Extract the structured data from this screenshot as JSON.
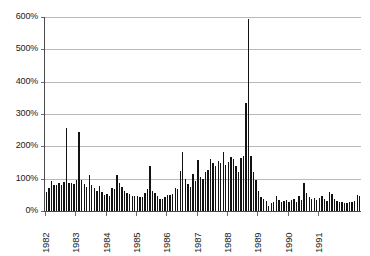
{
  "chart_data": {
    "type": "bar",
    "title": "",
    "subtitle": "",
    "xlabel": "",
    "ylabel": "",
    "ylim": [
      0,
      600
    ],
    "ytick_values": [
      0,
      100,
      200,
      300,
      400,
      500,
      600
    ],
    "ytick_labels": [
      "0%",
      "100%",
      "200%",
      "300%",
      "400%",
      "500%",
      "600%"
    ],
    "xtick_labels": [
      "1982",
      "1983",
      "1984",
      "1985",
      "1986",
      "1987",
      "1988",
      "1989",
      "1990",
      "1991"
    ],
    "grid": true,
    "legend": false,
    "bar_color": "#121212",
    "gridline_color": "#b9b9b9",
    "axis_color": "#4a4a4a",
    "x_start_year": 1982,
    "points_per_year": 12,
    "series": [
      {
        "name": "value",
        "values": [
          58,
          70,
          93,
          82,
          80,
          86,
          82,
          90,
          258,
          87,
          86,
          83,
          95,
          243,
          95,
          84,
          75,
          110,
          82,
          70,
          63,
          76,
          59,
          48,
          52,
          46,
          71,
          68,
          110,
          88,
          74,
          63,
          57,
          52,
          46,
          47,
          45,
          43,
          44,
          56,
          68,
          140,
          63,
          57,
          46,
          38,
          36,
          44,
          50,
          48,
          53,
          71,
          68,
          124,
          181,
          100,
          85,
          73,
          115,
          94,
          157,
          104,
          98,
          122,
          127,
          160,
          148,
          138,
          155,
          150,
          181,
          143,
          152,
          168,
          160,
          140,
          120,
          163,
          170,
          334,
          595,
          170,
          120,
          95,
          62,
          42,
          38,
          31,
          14,
          25,
          29,
          46,
          33,
          28,
          30,
          33,
          28,
          33,
          37,
          27,
          47,
          34,
          88,
          55,
          42,
          37,
          41,
          35,
          40,
          47,
          37,
          31,
          58,
          53,
          38,
          32,
          28,
          27,
          25,
          26,
          29,
          28,
          32,
          48,
          45
        ]
      }
    ]
  }
}
